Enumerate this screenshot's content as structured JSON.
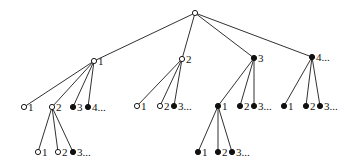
{
  "diagram": {
    "type": "tree",
    "nodes": [
      {
        "id": "root",
        "x": 195,
        "y": 13,
        "style": "open",
        "label": ""
      },
      {
        "id": "n1",
        "x": 94,
        "y": 61,
        "style": "open",
        "label": "1"
      },
      {
        "id": "n2",
        "x": 182,
        "y": 59,
        "style": "open",
        "label": "2"
      },
      {
        "id": "n3",
        "x": 254,
        "y": 58,
        "style": "filled",
        "label": "3"
      },
      {
        "id": "n4",
        "x": 312,
        "y": 57,
        "style": "filled",
        "label": "4..."
      },
      {
        "id": "n1_1",
        "x": 24,
        "y": 107,
        "style": "open",
        "label": "1"
      },
      {
        "id": "n1_2",
        "x": 52,
        "y": 107,
        "style": "open",
        "label": "2"
      },
      {
        "id": "n1_3",
        "x": 73,
        "y": 107,
        "style": "filled",
        "label": "3"
      },
      {
        "id": "n1_4",
        "x": 88,
        "y": 107,
        "style": "filled",
        "label": "4..."
      },
      {
        "id": "n2_1",
        "x": 137,
        "y": 106,
        "style": "open",
        "label": "1"
      },
      {
        "id": "n2_2",
        "x": 160,
        "y": 106,
        "style": "open",
        "label": "2"
      },
      {
        "id": "n2_3",
        "x": 174,
        "y": 106,
        "style": "filled",
        "label": "3..."
      },
      {
        "id": "n3_1",
        "x": 218,
        "y": 106,
        "style": "filled",
        "label": "1"
      },
      {
        "id": "n3_2",
        "x": 240,
        "y": 106,
        "style": "filled",
        "label": "2"
      },
      {
        "id": "n3_3",
        "x": 254,
        "y": 106,
        "style": "filled",
        "label": "3..."
      },
      {
        "id": "n4_1",
        "x": 284,
        "y": 106,
        "style": "filled",
        "label": "1"
      },
      {
        "id": "n4_2",
        "x": 306,
        "y": 106,
        "style": "filled",
        "label": "2"
      },
      {
        "id": "n4_3",
        "x": 320,
        "y": 106,
        "style": "filled",
        "label": "3..."
      },
      {
        "id": "n1_2_1",
        "x": 38,
        "y": 152,
        "style": "open",
        "label": "1"
      },
      {
        "id": "n1_2_2",
        "x": 58,
        "y": 152,
        "style": "open",
        "label": "2"
      },
      {
        "id": "n1_2_3",
        "x": 73,
        "y": 152,
        "style": "filled",
        "label": "3..."
      },
      {
        "id": "n3_1_1",
        "x": 198,
        "y": 152,
        "style": "filled",
        "label": "1"
      },
      {
        "id": "n3_1_2",
        "x": 218,
        "y": 152,
        "style": "filled",
        "label": "2"
      },
      {
        "id": "n3_1_3",
        "x": 232,
        "y": 152,
        "style": "filled",
        "label": "3..."
      }
    ],
    "edges": [
      [
        "root",
        "n1"
      ],
      [
        "root",
        "n2"
      ],
      [
        "root",
        "n3"
      ],
      [
        "root",
        "n4"
      ],
      [
        "n1",
        "n1_1"
      ],
      [
        "n1",
        "n1_2"
      ],
      [
        "n1",
        "n1_3"
      ],
      [
        "n1",
        "n1_4"
      ],
      [
        "n2",
        "n2_1"
      ],
      [
        "n2",
        "n2_2"
      ],
      [
        "n2",
        "n2_3"
      ],
      [
        "n3",
        "n3_1"
      ],
      [
        "n3",
        "n3_2"
      ],
      [
        "n3",
        "n3_3"
      ],
      [
        "n4",
        "n4_1"
      ],
      [
        "n4",
        "n4_2"
      ],
      [
        "n4",
        "n4_3"
      ],
      [
        "n1_2",
        "n1_2_1"
      ],
      [
        "n1_2",
        "n1_2_2"
      ],
      [
        "n1_2",
        "n1_2_3"
      ],
      [
        "n3_1",
        "n3_1_1"
      ],
      [
        "n3_1",
        "n3_1_2"
      ],
      [
        "n3_1",
        "n3_1_3"
      ]
    ],
    "node_radius": 2.6,
    "colors": {
      "line": "#1a1a1a",
      "filled": "#111111",
      "open_fill": "#ffffff"
    }
  }
}
